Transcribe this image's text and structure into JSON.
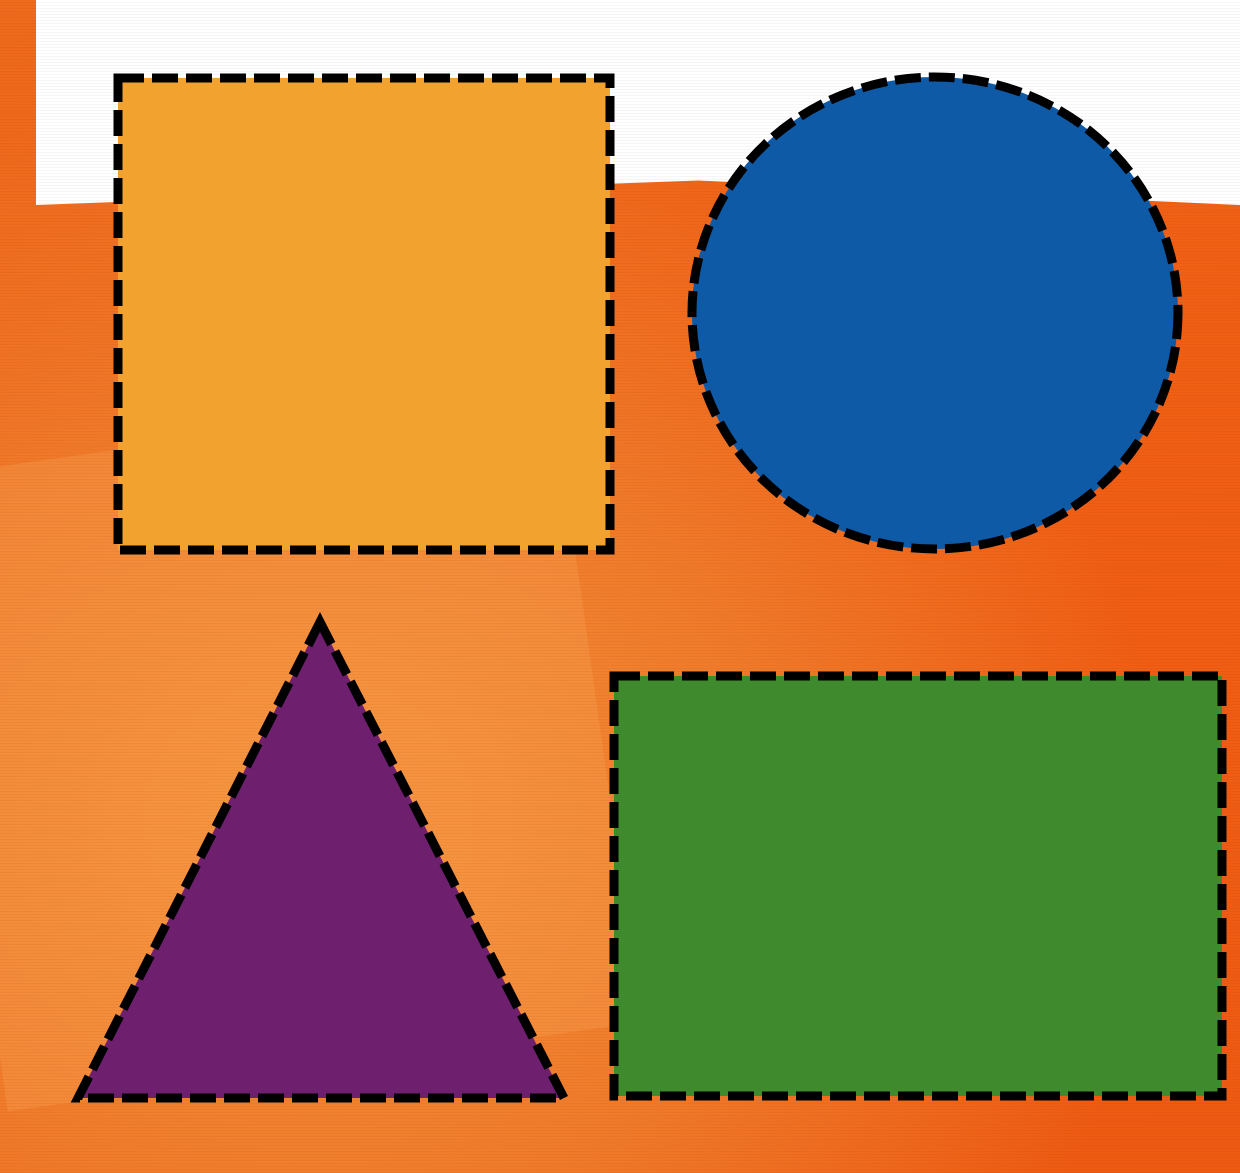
{
  "scene": {
    "description": "Four basic geometric shapes with black dashed outlines on an orange textured background",
    "background": {
      "primary_color": "#f26a1b",
      "light_panel_color": "#f6913a",
      "top_band_color": "#ffffff"
    },
    "shapes": [
      {
        "name": "square",
        "fill": "#f2a22e",
        "stroke": "#000000",
        "x": 118,
        "y": 78,
        "width": 492,
        "height": 472
      },
      {
        "name": "circle",
        "fill": "#0f5aa6",
        "stroke": "#000000",
        "cx": 935,
        "cy": 313,
        "rx": 243,
        "ry": 236
      },
      {
        "name": "triangle",
        "fill": "#6e1f6e",
        "stroke": "#000000",
        "points": [
          [
            320,
            622
          ],
          [
            78,
            1098
          ],
          [
            564,
            1098
          ]
        ]
      },
      {
        "name": "rectangle",
        "fill": "#3f8a2c",
        "stroke": "#000000",
        "x": 614,
        "y": 676,
        "width": 608,
        "height": 420
      }
    ]
  }
}
